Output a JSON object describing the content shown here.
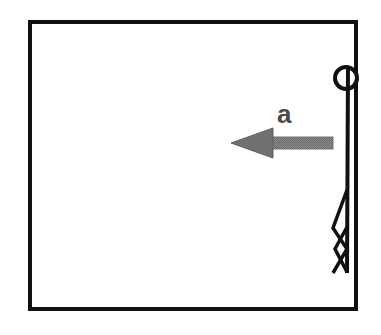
{
  "figure": {
    "kind": "physics-free-body-diagram",
    "background_color": "#ffffff",
    "frame": {
      "name": "enclosure-box",
      "stroke_color": "#111111",
      "stroke_width": 4,
      "x": 28,
      "y": 20,
      "width": 330,
      "height": 291
    },
    "stick_figure": {
      "name": "standing-person",
      "stroke_color": "#111111",
      "head": {
        "cx": 346,
        "cy": 78,
        "r": 11,
        "stroke_width": 4
      },
      "body_line": {
        "x1": 348,
        "y1": 88,
        "x2": 347,
        "y2": 272,
        "stroke_width": 4
      },
      "legs_stroke_width": 3,
      "leg_front": [
        [
          347,
          190
        ],
        [
          334,
          228
        ],
        [
          347,
          248
        ],
        [
          334,
          272
        ]
      ],
      "leg_back": [
        [
          347,
          228
        ],
        [
          336,
          248
        ],
        [
          347,
          272
        ]
      ]
    },
    "arrow": {
      "name": "acceleration-arrow",
      "direction": "left",
      "fill_color": "#808080",
      "edge_color": "#6e6e6e",
      "tip_x": 231,
      "tail_x": 333,
      "center_y": 143,
      "head_length": 41,
      "head_half_height": 15,
      "shaft_half_height": 6
    }
  },
  "labels": {
    "acceleration": "a"
  }
}
